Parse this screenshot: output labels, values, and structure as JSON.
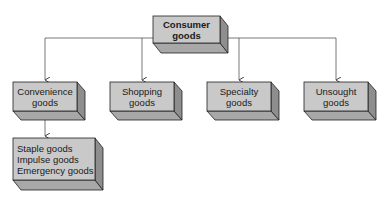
{
  "diagram": {
    "type": "hierarchy",
    "root": {
      "line1": "Consumer",
      "line2": "goods"
    },
    "children": [
      {
        "line1": "Convenience",
        "line2": "goods"
      },
      {
        "line1": "Shopping",
        "line2": "goods"
      },
      {
        "line1": "Specialty",
        "line2": "goods"
      },
      {
        "line1": "Unsought",
        "line2": "goods"
      }
    ],
    "convenience_subtypes": [
      "Staple goods",
      "Impulse goods",
      "Emergency goods"
    ],
    "colors": {
      "front": "#c9c9c9",
      "side": "#8e8e8e",
      "bottom": "#a8a8a8",
      "stroke": "#222222",
      "connector": "#555555"
    }
  }
}
